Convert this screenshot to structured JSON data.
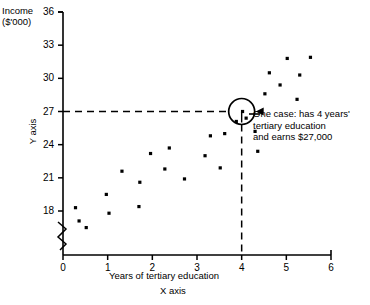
{
  "chart_data": {
    "type": "scatter",
    "title": "",
    "xlabel": "Years of tertiary education",
    "ylabel": "Income ($'000)",
    "x_axis_name": "X axis",
    "y_axis_name": "Y axis",
    "income_label": "Income",
    "income_units": "($'000)",
    "xlim": [
      0,
      6
    ],
    "ylim": [
      16.2,
      36
    ],
    "y_break": true,
    "grid": false,
    "legend": null,
    "xticks": [
      "0",
      "1",
      "2",
      "3",
      "4",
      "5",
      "6"
    ],
    "xtick_values": [
      0,
      1,
      2,
      3,
      4,
      5,
      6
    ],
    "yticks": [
      "18",
      "21",
      "24",
      "27",
      "30",
      "33",
      "36"
    ],
    "ytick_values": [
      18,
      21,
      24,
      27,
      30,
      33,
      36
    ],
    "points": [
      {
        "x": 0.28,
        "y": 18.3
      },
      {
        "x": 0.36,
        "y": 17.1
      },
      {
        "x": 0.52,
        "y": 16.5
      },
      {
        "x": 0.97,
        "y": 19.5
      },
      {
        "x": 1.03,
        "y": 17.8
      },
      {
        "x": 1.32,
        "y": 21.6
      },
      {
        "x": 1.72,
        "y": 20.6
      },
      {
        "x": 1.7,
        "y": 18.4
      },
      {
        "x": 1.96,
        "y": 23.2
      },
      {
        "x": 2.28,
        "y": 21.8
      },
      {
        "x": 2.38,
        "y": 23.7
      },
      {
        "x": 2.72,
        "y": 20.9
      },
      {
        "x": 3.18,
        "y": 23.0
      },
      {
        "x": 3.3,
        "y": 24.8
      },
      {
        "x": 3.52,
        "y": 21.9
      },
      {
        "x": 3.62,
        "y": 25.0
      },
      {
        "x": 3.88,
        "y": 26.1
      },
      {
        "x": 4.02,
        "y": 27.0
      },
      {
        "x": 4.1,
        "y": 26.4
      },
      {
        "x": 4.3,
        "y": 25.2
      },
      {
        "x": 4.36,
        "y": 23.4
      },
      {
        "x": 4.52,
        "y": 28.6
      },
      {
        "x": 4.62,
        "y": 30.5
      },
      {
        "x": 4.86,
        "y": 29.4
      },
      {
        "x": 5.02,
        "y": 31.8
      },
      {
        "x": 5.24,
        "y": 28.1
      },
      {
        "x": 5.3,
        "y": 30.3
      },
      {
        "x": 5.54,
        "y": 31.9
      }
    ],
    "highlight": {
      "x": 4.02,
      "y": 27.0,
      "annotation": [
        "One case: has 4 years'",
        "tertiary education",
        "and earns $27,000"
      ],
      "guide_y_value": 27,
      "guide_x_value": 4
    },
    "colors": {
      "axis": "#000000",
      "point": "#000000",
      "guide": "#000000",
      "background": "#ffffff"
    }
  }
}
